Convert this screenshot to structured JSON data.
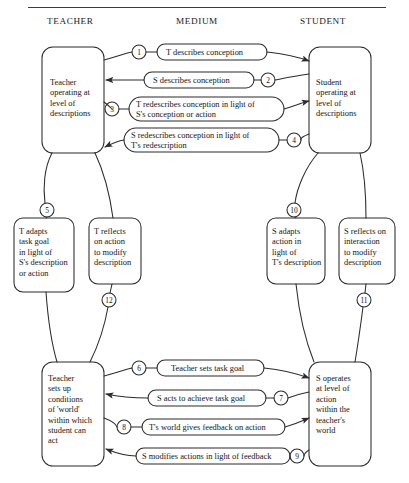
{
  "figure": {
    "title_rule": "top-horizontal-rule",
    "columns": [
      {
        "label": "TEACHER",
        "x": 47,
        "y": 16
      },
      {
        "label": "MEDIUM",
        "x": 176,
        "y": 16
      },
      {
        "label": "STUDENT",
        "x": 300,
        "y": 16
      }
    ]
  },
  "boxes": [
    {
      "id": "teacher-descriptions",
      "text": "Teacher\noperating at\nlevel of\ndescriptions",
      "x": 42,
      "y": 47,
      "w": 62,
      "h": 106,
      "tx": 50,
      "ty": 78
    },
    {
      "id": "student-descriptions",
      "text": "Student\noperating at\nlevel of\ndescriptions",
      "x": 309,
      "y": 47,
      "w": 62,
      "h": 106,
      "tx": 316,
      "ty": 78
    },
    {
      "id": "t-adapts-task-goal",
      "text": "T adapts\ntask goal\nin light of\nS's description\nor action",
      "x": 14,
      "y": 218,
      "w": 60,
      "h": 74,
      "tx": 19,
      "ty": 227
    },
    {
      "id": "t-reflects-on-action",
      "text": "T reflects\non action\nto modify\ndescription",
      "x": 89,
      "y": 218,
      "w": 52,
      "h": 66,
      "tx": 94,
      "ty": 227
    },
    {
      "id": "s-adapts-action",
      "text": "S adapts\naction in\nlight of\nT's description",
      "x": 267,
      "y": 218,
      "w": 58,
      "h": 66,
      "tx": 272,
      "ty": 227
    },
    {
      "id": "s-reflects-on-interaction",
      "text": "S reflects on\ninteraction\nto modify\ndescription",
      "x": 339,
      "y": 218,
      "w": 56,
      "h": 66,
      "tx": 344,
      "ty": 227
    },
    {
      "id": "teacher-sets-up-conditions",
      "text": "Teacher\nsets up\nconditions\nof 'world'\nwithin which\nstudent can\nact",
      "x": 42,
      "y": 362,
      "w": 62,
      "h": 104,
      "tx": 48,
      "ty": 374
    },
    {
      "id": "s-operates-level-of-action",
      "text": "S operates\nat level of\naction\nwithin the\nteacher's\nworld",
      "x": 309,
      "y": 362,
      "w": 62,
      "h": 104,
      "tx": 316,
      "ty": 374
    }
  ],
  "pills": [
    {
      "id": "pill-1",
      "label": "T describes conception",
      "number": "1",
      "direction": "left-to-right",
      "x": 157,
      "y": 44,
      "w": 110,
      "h": 16,
      "tx": 166,
      "ty": 48,
      "num_x": 139,
      "num_y": 52,
      "num_side": "left"
    },
    {
      "id": "pill-2",
      "label": "S describes conception",
      "number": "2",
      "direction": "right-to-left",
      "x": 144,
      "y": 72,
      "w": 110,
      "h": 16,
      "tx": 153,
      "ty": 76,
      "num_x": 268,
      "num_y": 80,
      "num_side": "right"
    },
    {
      "id": "pill-3",
      "label": "T redescribes conception in light of\nS's conception or action",
      "number": "3",
      "direction": "left-to-right",
      "x": 129,
      "y": 97,
      "w": 155,
      "h": 24,
      "tx": 136,
      "ty": 100,
      "num_x": 112,
      "num_y": 109,
      "num_side": "left"
    },
    {
      "id": "pill-4",
      "label": "S redescribes conception in light of\nT's redescription",
      "number": "4",
      "direction": "right-to-left",
      "x": 124,
      "y": 128,
      "w": 155,
      "h": 24,
      "tx": 131,
      "ty": 131,
      "num_x": 294,
      "num_y": 140,
      "num_side": "right"
    },
    {
      "id": "pill-6",
      "label": "Teacher sets task goal",
      "number": "6",
      "direction": "left-to-right",
      "x": 157,
      "y": 360,
      "w": 107,
      "h": 16,
      "tx": 171,
      "ty": 364,
      "num_x": 139,
      "num_y": 368,
      "num_side": "left"
    },
    {
      "id": "pill-7",
      "label": "S acts to achieve task goal",
      "number": "7",
      "direction": "right-to-left",
      "x": 148,
      "y": 390,
      "w": 118,
      "h": 16,
      "tx": 157,
      "ty": 394,
      "num_x": 281,
      "num_y": 398,
      "num_side": "right"
    },
    {
      "id": "pill-8",
      "label": "T's world gives feedback on action",
      "number": "8",
      "direction": "left-to-right",
      "x": 142,
      "y": 419,
      "w": 143,
      "h": 16,
      "tx": 149,
      "ty": 423,
      "num_x": 124,
      "num_y": 427,
      "num_side": "left"
    },
    {
      "id": "pill-9",
      "label": "S modifies actions in light of feedback",
      "number": "9",
      "direction": "right-to-left",
      "x": 136,
      "y": 448,
      "w": 154,
      "h": 16,
      "tx": 142,
      "ty": 452,
      "num_x": 297,
      "num_y": 456,
      "num_side": "right"
    }
  ],
  "vertical_nodes": [
    {
      "id": "node-5",
      "number": "5",
      "cx": 47,
      "cy": 210
    },
    {
      "id": "node-12",
      "number": "12",
      "cx": 109,
      "cy": 300
    },
    {
      "id": "node-10",
      "number": "10",
      "cx": 294,
      "cy": 210
    },
    {
      "id": "node-11",
      "number": "11",
      "cx": 364,
      "cy": 300
    }
  ],
  "colors": {
    "stroke": "#2b2b2b",
    "text": "#141414",
    "background": "#ffffff",
    "rule": "#3a3a3a"
  }
}
